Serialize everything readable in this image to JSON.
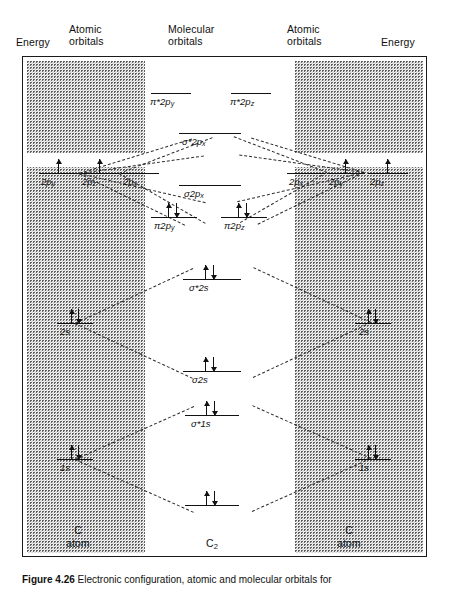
{
  "figure": {
    "caption_bold": "Figure 4.26",
    "caption_text": "Electronic configuration, atomic and molecular orbitals for",
    "width": 449,
    "height": 597
  },
  "headers": {
    "energy_left": "Energy",
    "atomic_left": "Atomic\norbitals",
    "molecular": "Molecular\norbitals",
    "atomic_right": "Atomic\norbitals",
    "energy_right": "Energy"
  },
  "species": {
    "left": "C\natom",
    "center_symbol": "C",
    "center_sub": "2",
    "center_word": "molecule",
    "right": "C\natom"
  },
  "molecular_orbitals": [
    {
      "id": "pi-star-2py",
      "sym": "π",
      "star": "*",
      "n": "2",
      "orb": "p",
      "sub": "y",
      "electrons": []
    },
    {
      "id": "pi-star-2pz",
      "sym": "π",
      "star": "*",
      "n": "2",
      "orb": "p",
      "sub": "z",
      "electrons": []
    },
    {
      "id": "sigma-star-2px",
      "sym": "σ",
      "star": "*",
      "n": "2",
      "orb": "p",
      "sub": "x",
      "electrons": []
    },
    {
      "id": "sigma-2px",
      "sym": "σ",
      "star": "",
      "n": "2",
      "orb": "p",
      "sub": "x",
      "electrons": []
    },
    {
      "id": "pi-2py",
      "sym": "π",
      "star": "",
      "n": "2",
      "orb": "p",
      "sub": "y",
      "electrons": [
        "up",
        "down"
      ]
    },
    {
      "id": "pi-2pz",
      "sym": "π",
      "star": "",
      "n": "2",
      "orb": "p",
      "sub": "z",
      "electrons": [
        "up",
        "down"
      ]
    },
    {
      "id": "sigma-star-2s",
      "sym": "σ",
      "star": "*",
      "n": "2",
      "orb": "s",
      "sub": "",
      "electrons": [
        "up",
        "down"
      ]
    },
    {
      "id": "sigma-2s",
      "sym": "σ",
      "star": "",
      "n": "2",
      "orb": "s",
      "sub": "",
      "electrons": [
        "up",
        "down"
      ]
    },
    {
      "id": "sigma-star-1s",
      "sym": "σ",
      "star": "*",
      "n": "1",
      "orb": "s",
      "sub": "",
      "electrons": [
        "up",
        "down"
      ]
    },
    {
      "id": "sigma-1s",
      "sym": "σ",
      "star": "",
      "n": "1",
      "orb": "s",
      "sub": "",
      "electrons": [
        "up",
        "down"
      ]
    }
  ],
  "atomic_orbitals_left": [
    {
      "id": "left-2py",
      "n": "2",
      "orb": "p",
      "sub": "y",
      "electrons": [
        "up"
      ]
    },
    {
      "id": "left-2pz",
      "n": "2",
      "orb": "p",
      "sub": "z",
      "electrons": [
        "up"
      ]
    },
    {
      "id": "left-2px",
      "n": "2",
      "orb": "p",
      "sub": "x",
      "electrons": []
    },
    {
      "id": "left-2s",
      "n": "2",
      "orb": "s",
      "sub": "",
      "electrons": [
        "up",
        "down"
      ]
    },
    {
      "id": "left-1s",
      "n": "1",
      "orb": "s",
      "sub": "",
      "electrons": [
        "up",
        "down"
      ]
    }
  ],
  "atomic_orbitals_right": [
    {
      "id": "right-2px",
      "n": "2",
      "orb": "p",
      "sub": "x",
      "electrons": []
    },
    {
      "id": "right-2py",
      "n": "2",
      "orb": "p",
      "sub": "y",
      "electrons": [
        "up"
      ]
    },
    {
      "id": "right-2pz",
      "n": "2",
      "orb": "p",
      "sub": "z",
      "electrons": [
        "up"
      ]
    },
    {
      "id": "right-2s",
      "n": "2",
      "orb": "s",
      "sub": "",
      "electrons": [
        "up",
        "down"
      ]
    },
    {
      "id": "right-1s",
      "n": "1",
      "orb": "s",
      "sub": "",
      "electrons": [
        "up",
        "down"
      ]
    }
  ],
  "labels": {
    "pi_star_2py": "π*2p",
    "pi_star_2pz": "π*2p",
    "sigma_star_2px": "σ*2p",
    "sigma_2px": "σ2p",
    "pi_2py": "π2p",
    "pi_2pz": "π2p",
    "sigma_star_2s": "σ*2s",
    "sigma_2s": "σ2s",
    "sigma_star_1s": "σ*1s",
    "l_2py": "2p",
    "l_2pz": "2p",
    "l_2px": "2p",
    "l_2s": "2s",
    "l_1s": "1s",
    "r_2px": "2p",
    "r_2py": "2p",
    "r_2pz": "2p",
    "r_2s": "2s",
    "r_1s": "1s",
    "sub_x": "x",
    "sub_y": "y",
    "sub_z": "z"
  },
  "colors": {
    "ink": "#111111",
    "stipple_dark": "#5a5a5a",
    "stipple_light": "#8a8a8a",
    "paper": "#ffffff"
  }
}
